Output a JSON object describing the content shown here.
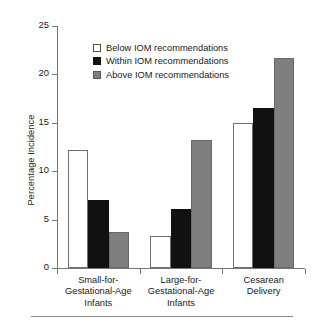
{
  "chart_data": {
    "type": "bar",
    "title": "",
    "xlabel": "",
    "ylabel": "Percentage Incidence",
    "ylim": [
      0,
      25
    ],
    "yticks": [
      0,
      5,
      10,
      15,
      20,
      25
    ],
    "grid": false,
    "legend_position": "upper-left-inside",
    "categories": [
      "Small-for-Gestational-Age Infants",
      "Large-for-Gestational-Age Infants",
      "Cesarean Delivery"
    ],
    "category_lines": [
      [
        "Small-for-",
        "Gestational-Age",
        "Infants"
      ],
      [
        "Large-for-",
        "Gestational-Age",
        "Infants"
      ],
      [
        "Cesarean",
        "Delivery"
      ]
    ],
    "series": [
      {
        "name": "Below IOM recommendations",
        "key": "below",
        "color": "#ffffff",
        "values": [
          12.2,
          3.3,
          15.0
        ]
      },
      {
        "name": "Within IOM recommendations",
        "key": "within",
        "color": "#111111",
        "values": [
          7.0,
          6.1,
          16.5
        ]
      },
      {
        "name": "Above IOM recommendations",
        "key": "above",
        "color": "#7f7f7f",
        "values": [
          3.7,
          13.2,
          21.7
        ]
      }
    ]
  },
  "axis": {
    "y_title": "Percentage Incidence",
    "tick_labels": [
      "0",
      "5",
      "10",
      "15",
      "20",
      "25"
    ]
  },
  "legend": {
    "items": [
      {
        "label": "Below IOM recommendations",
        "swatch": "below"
      },
      {
        "label": "Within IOM recommendations",
        "swatch": "within"
      },
      {
        "label": "Above IOM recommendations",
        "swatch": "above"
      }
    ]
  },
  "colors": {
    "below": "#ffffff",
    "within": "#111111",
    "above": "#7f7f7f",
    "axis": "#757575",
    "text": "#1a1a1a"
  }
}
